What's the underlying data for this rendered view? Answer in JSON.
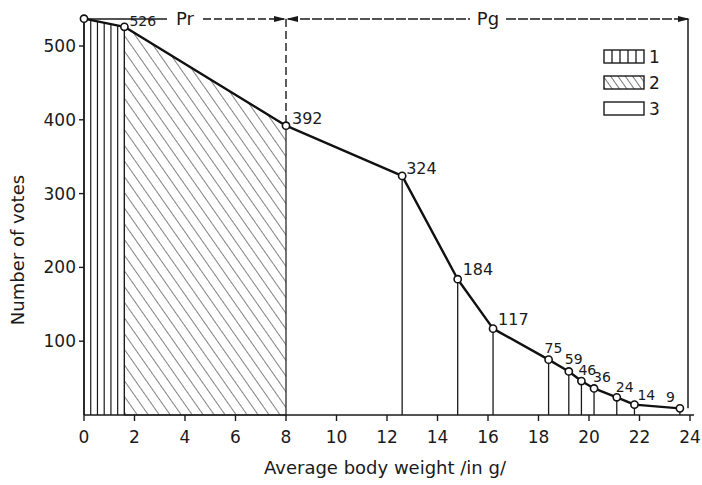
{
  "chart_data": {
    "type": "line",
    "title": "",
    "xlabel": "Average body weight /in g/",
    "ylabel": "Number of votes",
    "xlim": [
      0,
      24
    ],
    "ylim": [
      0,
      540
    ],
    "x_ticks": [
      "0",
      "2",
      "4",
      "6",
      "8",
      "10",
      "12",
      "14",
      "16",
      "18",
      "20",
      "22",
      "24"
    ],
    "y_ticks": [
      "100",
      "200",
      "300",
      "400",
      "500"
    ],
    "grid": false,
    "series": [
      {
        "name": "votes",
        "points": [
          {
            "x": 0,
            "y": 537,
            "label": ""
          },
          {
            "x": 1.6,
            "y": 526,
            "label": "526"
          },
          {
            "x": 8.0,
            "y": 392,
            "label": "392"
          },
          {
            "x": 12.6,
            "y": 324,
            "label": "324"
          },
          {
            "x": 14.8,
            "y": 184,
            "label": "184"
          },
          {
            "x": 16.2,
            "y": 117,
            "label": "117"
          },
          {
            "x": 18.4,
            "y": 75,
            "label": "75"
          },
          {
            "x": 19.2,
            "y": 59,
            "label": "59"
          },
          {
            "x": 19.7,
            "y": 46,
            "label": "46"
          },
          {
            "x": 20.2,
            "y": 36,
            "label": "36"
          },
          {
            "x": 21.1,
            "y": 24,
            "label": "24"
          },
          {
            "x": 21.8,
            "y": 14,
            "label": "14"
          },
          {
            "x": 23.6,
            "y": 9,
            "label": "9"
          }
        ]
      }
    ],
    "regions": [
      {
        "id": "1",
        "pattern": "vertical-lines",
        "x_start": 0,
        "x_end": 1.6
      },
      {
        "id": "2",
        "pattern": "diagonal-hatch",
        "x_start": 1.6,
        "x_end": 8.0
      },
      {
        "id": "3",
        "pattern": "empty",
        "x_start": 8.0,
        "x_end": 24
      }
    ],
    "annotations": [
      {
        "text": "Pr",
        "x_range": [
          0,
          8
        ],
        "position": "top"
      },
      {
        "text": "Pg",
        "x_range": [
          8,
          24
        ],
        "position": "top"
      }
    ],
    "legend": {
      "position": "top-right",
      "entries": [
        {
          "label": "1",
          "pattern": "vertical-lines"
        },
        {
          "label": "2",
          "pattern": "diagonal-hatch"
        },
        {
          "label": "3",
          "pattern": "empty"
        }
      ]
    }
  }
}
